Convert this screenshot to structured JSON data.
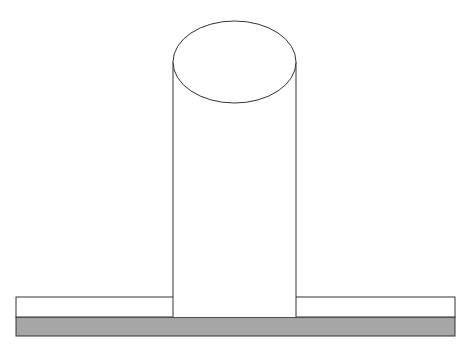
{
  "diagram": {
    "colors": {
      "stroke": "#333333",
      "fill": "#ffffff",
      "base_fill": "#a6a6a6"
    },
    "components": [
      "cylinder",
      "plate",
      "base-layer"
    ]
  }
}
